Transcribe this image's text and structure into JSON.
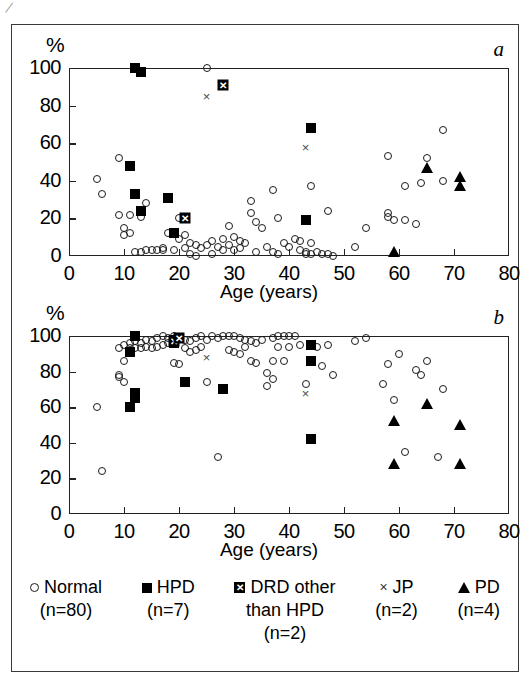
{
  "figure": {
    "artifact_mark": "/",
    "panels": [
      {
        "letter": "a",
        "y_axis_label": "%",
        "x_axis_title": "Age (years)",
        "yticks": [
          "0",
          "20",
          "40",
          "60",
          "80",
          "100"
        ],
        "xticks": [
          "0",
          "10",
          "20",
          "30",
          "40",
          "50",
          "60",
          "70",
          "80"
        ]
      },
      {
        "letter": "b",
        "y_axis_label": "%",
        "x_axis_title": "Age (years)",
        "yticks": [
          "0",
          "20",
          "40",
          "60",
          "80",
          "100"
        ],
        "xticks": [
          "0",
          "10",
          "20",
          "30",
          "40",
          "50",
          "60",
          "70",
          "80"
        ]
      }
    ]
  },
  "legend": {
    "items": [
      {
        "marker": "open-circle-icon",
        "glyph": "",
        "label": "Normal",
        "n": "(n=80)",
        "label2": ""
      },
      {
        "marker": "filled-square-icon",
        "glyph": "",
        "label": "HPD",
        "n": "(n=7)",
        "label2": ""
      },
      {
        "marker": "crossed-square-icon",
        "glyph": "✕",
        "label": "DRD other",
        "n": "(n=2)",
        "label2": "than HPD"
      },
      {
        "marker": "x-cross-icon",
        "glyph": "×",
        "label": "JP",
        "n": "(n=2)",
        "label2": ""
      },
      {
        "marker": "filled-triangle-icon",
        "glyph": "",
        "label": "PD",
        "n": "(n=4)",
        "label2": ""
      }
    ]
  },
  "chart_data": [
    {
      "type": "scatter",
      "panel": "a",
      "title": "",
      "xlabel": "Age (years)",
      "ylabel": "%",
      "xlim": [
        0,
        80
      ],
      "ylim": [
        0,
        100
      ],
      "xticks": [
        0,
        10,
        20,
        30,
        40,
        50,
        60,
        70,
        80
      ],
      "yticks": [
        0,
        20,
        40,
        60,
        80,
        100
      ],
      "grid": false,
      "legend_position": "bottom",
      "series": [
        {
          "name": "Normal",
          "marker": "open-circle",
          "points": [
            [
              5,
              41
            ],
            [
              6,
              33
            ],
            [
              9,
              52
            ],
            [
              9,
              22
            ],
            [
              10,
              15
            ],
            [
              10,
              11
            ],
            [
              11,
              12
            ],
            [
              11,
              22
            ],
            [
              12,
              2
            ],
            [
              13,
              2
            ],
            [
              13,
              21
            ],
            [
              14,
              28
            ],
            [
              14,
              3
            ],
            [
              15,
              3
            ],
            [
              16,
              3
            ],
            [
              17,
              3
            ],
            [
              17,
              4
            ],
            [
              18,
              12
            ],
            [
              19,
              3
            ],
            [
              20,
              20
            ],
            [
              20,
              9
            ],
            [
              21,
              11
            ],
            [
              21,
              4
            ],
            [
              22,
              7
            ],
            [
              22,
              1
            ],
            [
              23,
              6
            ],
            [
              23,
              0
            ],
            [
              24,
              4
            ],
            [
              25,
              100
            ],
            [
              25,
              6
            ],
            [
              26,
              8
            ],
            [
              26,
              1
            ],
            [
              27,
              5
            ],
            [
              28,
              3
            ],
            [
              28,
              9
            ],
            [
              29,
              16
            ],
            [
              29,
              6
            ],
            [
              30,
              10
            ],
            [
              30,
              3
            ],
            [
              31,
              8
            ],
            [
              31,
              4
            ],
            [
              32,
              7
            ],
            [
              33,
              23
            ],
            [
              33,
              29
            ],
            [
              34,
              18
            ],
            [
              34,
              2
            ],
            [
              35,
              15
            ],
            [
              36,
              5
            ],
            [
              37,
              35
            ],
            [
              37,
              2
            ],
            [
              38,
              20
            ],
            [
              38,
              1
            ],
            [
              39,
              7
            ],
            [
              40,
              5
            ],
            [
              41,
              9
            ],
            [
              42,
              8
            ],
            [
              42,
              3
            ],
            [
              43,
              2
            ],
            [
              43,
              1
            ],
            [
              44,
              37
            ],
            [
              44,
              7
            ],
            [
              44,
              1
            ],
            [
              45,
              2
            ],
            [
              46,
              1
            ],
            [
              47,
              24
            ],
            [
              47,
              1
            ],
            [
              48,
              0
            ],
            [
              52,
              5
            ],
            [
              54,
              15
            ],
            [
              58,
              53
            ],
            [
              58,
              21
            ],
            [
              58,
              23
            ],
            [
              59,
              19
            ],
            [
              61,
              37
            ],
            [
              61,
              19
            ],
            [
              63,
              17
            ],
            [
              64,
              39
            ],
            [
              65,
              52
            ],
            [
              68,
              67
            ],
            [
              68,
              40
            ]
          ]
        },
        {
          "name": "HPD",
          "marker": "filled-square",
          "points": [
            [
              12,
              100
            ],
            [
              13,
              98
            ],
            [
              11,
              48
            ],
            [
              12,
              33
            ],
            [
              13,
              24
            ],
            [
              18,
              31
            ],
            [
              19,
              12
            ],
            [
              43,
              19
            ],
            [
              44,
              68
            ]
          ]
        },
        {
          "name": "DRD other than HPD",
          "marker": "crossed-square",
          "points": [
            [
              28,
              91
            ],
            [
              21,
              20
            ]
          ]
        },
        {
          "name": "JP",
          "marker": "x-cross",
          "points": [
            [
              25,
              85
            ],
            [
              43,
              58
            ]
          ]
        },
        {
          "name": "PD",
          "marker": "filled-triangle",
          "points": [
            [
              59,
              2
            ],
            [
              65,
              47
            ],
            [
              71,
              42
            ],
            [
              71,
              37
            ]
          ]
        }
      ]
    },
    {
      "type": "scatter",
      "panel": "b",
      "title": "",
      "xlabel": "Age (years)",
      "ylabel": "%",
      "xlim": [
        0,
        80
      ],
      "ylim": [
        0,
        100
      ],
      "xticks": [
        0,
        10,
        20,
        30,
        40,
        50,
        60,
        70,
        80
      ],
      "yticks": [
        0,
        20,
        40,
        60,
        80,
        100
      ],
      "grid": false,
      "legend_position": "bottom",
      "series": [
        {
          "name": "Normal",
          "marker": "open-circle",
          "points": [
            [
              5,
              60
            ],
            [
              6,
              24
            ],
            [
              9,
              93
            ],
            [
              9,
              78
            ],
            [
              9,
              77
            ],
            [
              10,
              95
            ],
            [
              10,
              86
            ],
            [
              10,
              74
            ],
            [
              11,
              96
            ],
            [
              11,
              93
            ],
            [
              12,
              97
            ],
            [
              12,
              93
            ],
            [
              13,
              96
            ],
            [
              13,
              93
            ],
            [
              14,
              98
            ],
            [
              14,
              94
            ],
            [
              15,
              97
            ],
            [
              15,
              93
            ],
            [
              16,
              99
            ],
            [
              16,
              94
            ],
            [
              17,
              100
            ],
            [
              17,
              95
            ],
            [
              18,
              99
            ],
            [
              18,
              96
            ],
            [
              19,
              100
            ],
            [
              19,
              85
            ],
            [
              20,
              99
            ],
            [
              20,
              84
            ],
            [
              21,
              98
            ],
            [
              21,
              93
            ],
            [
              22,
              97
            ],
            [
              22,
              91
            ],
            [
              23,
              99
            ],
            [
              23,
              92
            ],
            [
              24,
              100
            ],
            [
              24,
              94
            ],
            [
              25,
              98
            ],
            [
              25,
              74
            ],
            [
              26,
              100
            ],
            [
              27,
              99
            ],
            [
              27,
              32
            ],
            [
              28,
              100
            ],
            [
              29,
              100
            ],
            [
              29,
              92
            ],
            [
              30,
              100
            ],
            [
              30,
              91
            ],
            [
              31,
              99
            ],
            [
              31,
              90
            ],
            [
              32,
              98
            ],
            [
              32,
              94
            ],
            [
              33,
              97
            ],
            [
              33,
              86
            ],
            [
              34,
              96
            ],
            [
              34,
              85
            ],
            [
              35,
              98
            ],
            [
              36,
              79
            ],
            [
              36,
              72
            ],
            [
              37,
              99
            ],
            [
              37,
              86
            ],
            [
              37,
              76
            ],
            [
              38,
              100
            ],
            [
              38,
              94
            ],
            [
              39,
              100
            ],
            [
              39,
              86
            ],
            [
              40,
              100
            ],
            [
              40,
              94
            ],
            [
              41,
              100
            ],
            [
              42,
              95
            ],
            [
              43,
              73
            ],
            [
              44,
              95
            ],
            [
              45,
              94
            ],
            [
              46,
              83
            ],
            [
              47,
              95
            ],
            [
              48,
              78
            ],
            [
              52,
              97
            ],
            [
              54,
              99
            ],
            [
              57,
              73
            ],
            [
              58,
              84
            ],
            [
              59,
              64
            ],
            [
              60,
              90
            ],
            [
              61,
              35
            ],
            [
              63,
              81
            ],
            [
              64,
              78
            ],
            [
              65,
              86
            ],
            [
              67,
              32
            ],
            [
              68,
              70
            ]
          ]
        },
        {
          "name": "HPD",
          "marker": "filled-square",
          "points": [
            [
              12,
              101
            ],
            [
              11,
              91
            ],
            [
              12,
              68
            ],
            [
              12,
              65
            ],
            [
              11,
              60
            ],
            [
              19,
              98
            ],
            [
              19,
              96
            ],
            [
              21,
              74
            ],
            [
              28,
              70
            ],
            [
              44,
              95
            ],
            [
              44,
              86
            ],
            [
              44,
              42
            ]
          ]
        },
        {
          "name": "DRD other than HPD",
          "marker": "crossed-square",
          "points": [
            [
              19,
              97
            ],
            [
              20,
              99
            ]
          ]
        },
        {
          "name": "JP",
          "marker": "x-cross",
          "points": [
            [
              25,
              88
            ],
            [
              43,
              68
            ]
          ]
        },
        {
          "name": "PD",
          "marker": "filled-triangle",
          "points": [
            [
              59,
              52
            ],
            [
              59,
              28
            ],
            [
              65,
              62
            ],
            [
              71,
              50
            ],
            [
              71,
              28
            ]
          ]
        }
      ]
    }
  ]
}
